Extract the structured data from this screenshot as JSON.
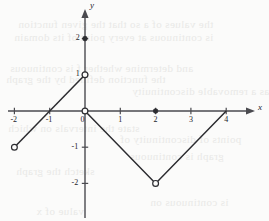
{
  "chart_data": {
    "type": "line",
    "title": "",
    "xlabel": "x",
    "ylabel": "y",
    "xlim": [
      -2.3,
      4.8
    ],
    "ylim": [
      -3.0,
      2.9
    ],
    "grid": false,
    "legend": null,
    "x_ticks": [
      {
        "value": -2,
        "label": "-2"
      },
      {
        "value": -1,
        "label": "-1"
      },
      {
        "value": 0,
        "label": "0"
      },
      {
        "value": 1,
        "label": "1"
      },
      {
        "value": 2,
        "label": "2"
      },
      {
        "value": 3,
        "label": "3"
      },
      {
        "value": 4,
        "label": "4"
      }
    ],
    "y_ticks": [
      {
        "value": 2,
        "label": "2"
      },
      {
        "value": 1,
        "label": "1"
      },
      {
        "value": -1,
        "label": "-1"
      },
      {
        "value": -2,
        "label": "-2"
      }
    ],
    "series": [
      {
        "name": "branch-1",
        "points": [
          [
            -2,
            -1
          ],
          [
            0,
            1
          ]
        ]
      },
      {
        "name": "branch-2",
        "points": [
          [
            0,
            0
          ],
          [
            2,
            -2
          ],
          [
            4,
            0
          ]
        ]
      }
    ],
    "endpoints": [
      {
        "name": "open-endpoint-left",
        "x": -2,
        "y": -1,
        "filled": false
      },
      {
        "name": "open-endpoint-0-1",
        "x": 0,
        "y": 1,
        "filled": false
      },
      {
        "name": "open-endpoint-origin",
        "x": 0,
        "y": 0,
        "filled": false
      },
      {
        "name": "open-endpoint-vertex",
        "x": 2,
        "y": -2,
        "filled": false
      },
      {
        "name": "filled-point-0-2",
        "x": 0,
        "y": 2,
        "filled": true
      },
      {
        "name": "filled-point-2-0",
        "x": 2,
        "y": 0,
        "filled": true
      }
    ],
    "colors": {
      "curve": "#2c2c30",
      "axis": "#4a4a4f",
      "background": "#fbfbfa",
      "bleed_text": "#e9e9e7"
    }
  },
  "bleed_lines": [
    {
      "text": "the values of a so that the given function",
      "x": 18,
      "y": 18
    },
    {
      "text": "is continuous at every point of its domain",
      "x": 14,
      "y": 31
    },
    {
      "text": "and determine whether f is continuous",
      "x": 10,
      "y": 62
    },
    {
      "text": "the function defined by the graph",
      "x": 6,
      "y": 73
    },
    {
      "text": "has a removable discontinuity",
      "x": 132,
      "y": 85
    },
    {
      "text": "state the intervals on which",
      "x": 8,
      "y": 122
    },
    {
      "text": "points of discontinuity of",
      "x": 120,
      "y": 133
    },
    {
      "text": "graph is continuous",
      "x": 130,
      "y": 150
    },
    {
      "text": "sketch the graph",
      "x": 16,
      "y": 165
    },
    {
      "text": "is continuous on",
      "x": 150,
      "y": 196
    },
    {
      "text": "value of x",
      "x": 36,
      "y": 205
    }
  ]
}
